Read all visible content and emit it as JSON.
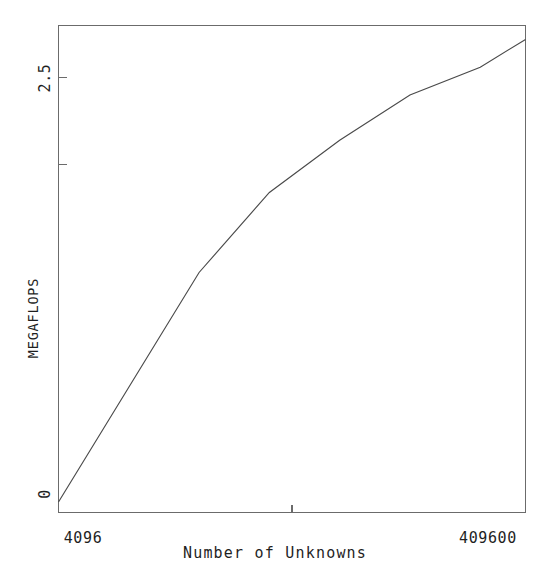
{
  "chart_data": {
    "type": "line",
    "title": "",
    "subtitle": "",
    "xlabel": "Number of Unknowns",
    "ylabel": "MEGAFLOPS",
    "xscale": "log",
    "yscale": "linear",
    "xlim": [
      4096,
      409600
    ],
    "ylim": [
      0,
      2.8
    ],
    "grid": false,
    "legend": null,
    "legend_position": "none",
    "x_tick_labels": [
      "4096",
      "409600"
    ],
    "x_tick_values": [
      4096,
      409600
    ],
    "x_minor_tick_values": [
      40960
    ],
    "y_tick_labels": [
      "0",
      "2.5"
    ],
    "y_tick_values": [
      0,
      2.5
    ],
    "y_minor_tick_values": [
      1.0,
      2.0
    ],
    "series": [
      {
        "name": "MEGAFLOPS",
        "x": [
          4096,
          8192,
          16384,
          32768,
          65536,
          131072,
          262144,
          409600
        ],
        "values": [
          0.06,
          0.72,
          1.38,
          1.84,
          2.14,
          2.4,
          2.56,
          2.72
        ]
      }
    ],
    "annotations": []
  },
  "axes": {
    "y_label_text": "MEGAFLOPS",
    "y_tick_top_text": "2.5",
    "y_tick_bottom_text": "0",
    "x_label_text": "Number of Unknowns",
    "x_tick_left_text": "4096",
    "x_tick_right_text": "409600"
  },
  "style": {
    "background": "#ffffff",
    "frame_color": "#6b6b6b",
    "line_color": "#4a4a4a",
    "text_color": "#1f1f1f"
  }
}
